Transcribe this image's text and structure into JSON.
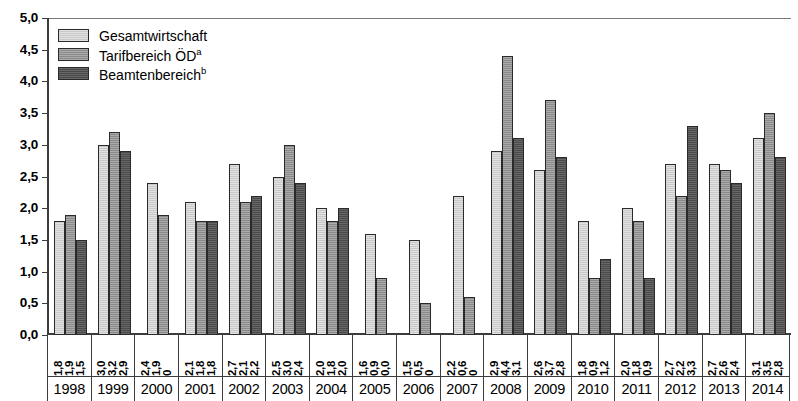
{
  "chart_data": {
    "type": "bar",
    "title": "",
    "subtitle": "",
    "xlabel": "",
    "ylabel": "",
    "ylim": [
      0.0,
      5.0
    ],
    "ytick_step": 0.5,
    "ytick_labels": [
      "0,0",
      "0,5",
      "1,0",
      "1,5",
      "2,0",
      "2,5",
      "3,0",
      "3,5",
      "4,0",
      "4,5",
      "5,0"
    ],
    "grid": false,
    "legend_position": "top-left",
    "decimal_separator": ",",
    "categories": [
      "1998",
      "1999",
      "2000",
      "2001",
      "2002",
      "2003",
      "2004",
      "2005",
      "2006",
      "2007",
      "2008",
      "2009",
      "2010",
      "2011",
      "2012",
      "2013",
      "2014"
    ],
    "series": [
      {
        "name": "Gesamtwirtschaft",
        "color": "#c9c9c9",
        "values": [
          1.8,
          3.0,
          2.4,
          2.1,
          2.7,
          2.5,
          2.0,
          1.6,
          1.5,
          2.2,
          2.9,
          2.6,
          1.8,
          2.0,
          2.7,
          2.7,
          3.1
        ],
        "labels": [
          "1,8",
          "3,0",
          "2,4",
          "2,1",
          "2,7",
          "2,5",
          "2,0",
          "1,6",
          "1,5",
          "2,2",
          "2,9",
          "2,6",
          "1,8",
          "2,0",
          "2,7",
          "2,7",
          "3,1"
        ]
      },
      {
        "name": "Tarifbereich ÖD",
        "footnote": "a",
        "color": "#8a8a8a",
        "values": [
          1.9,
          3.2,
          1.9,
          1.8,
          2.1,
          3.0,
          1.8,
          0.9,
          0.5,
          0.6,
          4.4,
          3.7,
          0.9,
          1.8,
          2.2,
          2.6,
          3.5
        ],
        "labels": [
          "1,9",
          "3,2",
          "1,9",
          "1,8",
          "2,1",
          "3,0",
          "1,8",
          "0,9",
          "0,5",
          "0,6",
          "4,4",
          "3,7",
          "0,9",
          "1,8",
          "2,2",
          "2,6",
          "3,5"
        ]
      },
      {
        "name": "Beamtenbereich",
        "footnote": "b",
        "color": "#4a4a4a",
        "values": [
          1.5,
          2.9,
          0.0,
          1.8,
          2.2,
          2.4,
          2.0,
          0.0,
          0.0,
          0.0,
          3.1,
          2.8,
          1.2,
          0.9,
          3.3,
          2.4,
          2.8
        ],
        "labels": [
          "1,5",
          "2,9",
          "0",
          "1,8",
          "2,2",
          "2,4",
          "2,0",
          "0,0",
          "0",
          "0",
          "3,1",
          "2,8",
          "1,2",
          "0,9",
          "3,3",
          "2,4",
          "2,8"
        ]
      }
    ]
  },
  "legend": {
    "items": [
      {
        "label": "Gesamtwirtschaft",
        "footnote": "",
        "swatch": "#c9c9c9"
      },
      {
        "label": "Tarifbereich ÖD",
        "footnote": "a",
        "swatch": "#8a8a8a"
      },
      {
        "label": "Beamtenbereich",
        "footnote": "b",
        "swatch": "#4a4a4a"
      }
    ]
  },
  "axis": {
    "y_labels": [
      "5,0",
      "4,5",
      "4,0",
      "3,5",
      "3,0",
      "2,5",
      "2,0",
      "1,5",
      "1,0",
      "0,5",
      "0,0"
    ]
  }
}
